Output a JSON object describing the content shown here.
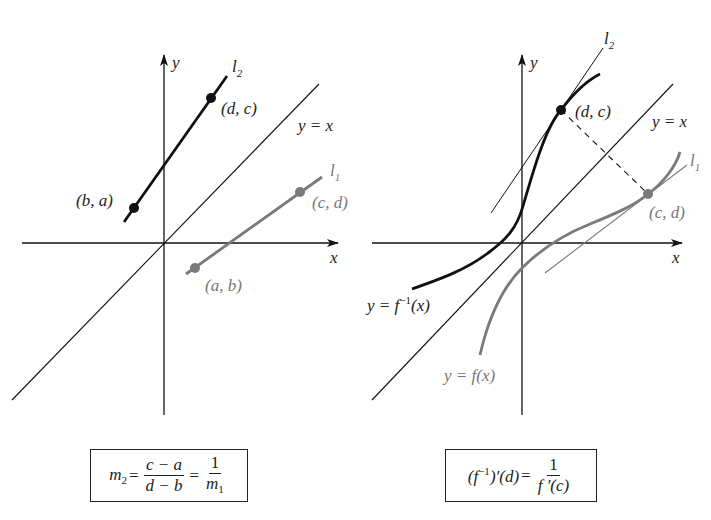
{
  "left_panel": {
    "axis_x_label": "x",
    "axis_y_label": "y",
    "diagonal_label": "y = x",
    "line_l2_label": "l",
    "line_l2_sub": "2",
    "line_l1_label": "l",
    "line_l1_sub": "1",
    "points": [
      {
        "label": "(b, a)",
        "color": "#111111"
      },
      {
        "label": "(d, c)",
        "color": "#111111"
      },
      {
        "label": "(a, b)",
        "color": "#777777"
      },
      {
        "label": "(c, d)",
        "color": "#777777"
      }
    ],
    "formula": {
      "lhs": "m",
      "lhs_sub": "2",
      "eq1": "=",
      "frac1_num": "c − a",
      "frac1_den": "d − b",
      "eq2": "=",
      "frac2_num": "1",
      "frac2_den": "m",
      "frac2_den_sub": "1"
    }
  },
  "right_panel": {
    "axis_x_label": "x",
    "axis_y_label": "y",
    "diagonal_label": "y = x",
    "line_l2_label": "l",
    "line_l2_sub": "2",
    "line_l1_label": "l",
    "line_l1_sub": "1",
    "curve_inverse_label_prefix": "y = f",
    "curve_inverse_label_sup": "−1",
    "curve_inverse_label_suffix": "(x)",
    "curve_f_label": "y = f(x)",
    "points": [
      {
        "label": "(d, c)",
        "color": "#111111"
      },
      {
        "label": "(c, d)",
        "color": "#777777"
      }
    ],
    "formula": {
      "lhs_open": "(f",
      "lhs_sup": "−1",
      "lhs_close": ")′(d)",
      "eq": "=",
      "frac_num": "1",
      "frac_den": "f ′(c)"
    }
  },
  "colors": {
    "ink": "#111111",
    "gray": "#7a7a7a",
    "background": "#ffffff"
  }
}
